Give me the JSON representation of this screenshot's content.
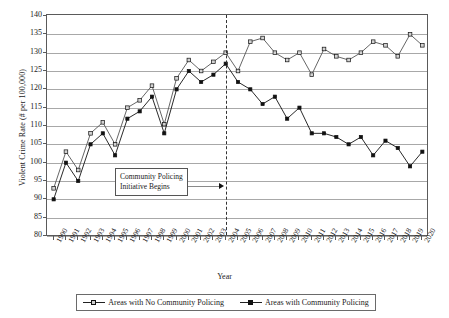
{
  "chart_data": {
    "type": "line",
    "title": "",
    "xlabel": "Year",
    "ylabel": "Violent Crime Rate (# per 100,000)",
    "ylim": [
      80,
      140
    ],
    "ytick_step": 5,
    "yticks": [
      140,
      135,
      130,
      125,
      120,
      115,
      110,
      105,
      100,
      95,
      90,
      85,
      80
    ],
    "grid": true,
    "legend_position": "bottom",
    "categories": [
      "1990",
      "1991",
      "1992",
      "1993",
      "1994",
      "1995",
      "1996",
      "1997",
      "1998",
      "1999",
      "2000",
      "2001",
      "2002",
      "2003",
      "2004",
      "2005",
      "2006",
      "2007",
      "2008",
      "2009",
      "2010",
      "2011",
      "2012",
      "2013",
      "2014",
      "2015",
      "2016",
      "2017",
      "2018",
      "2019",
      "2020"
    ],
    "series": [
      {
        "name": "Areas with No Community Policing",
        "marker": "open-square",
        "values": [
          93,
          103,
          98,
          108,
          111,
          105,
          115,
          117,
          121,
          110.5,
          123,
          128,
          125,
          127.5,
          130,
          125,
          133,
          134,
          130,
          128,
          130,
          124,
          131,
          129,
          128,
          130,
          133,
          132,
          129,
          135,
          132
        ]
      },
      {
        "name": "Areas with Community Policing",
        "marker": "filled-square",
        "values": [
          90,
          100,
          95,
          105,
          108,
          102,
          112,
          114,
          118,
          108,
          120,
          125,
          122,
          124,
          127,
          122,
          120,
          116,
          118,
          112,
          115,
          108,
          108,
          107,
          105,
          107,
          102,
          106,
          104,
          99,
          103
        ]
      }
    ],
    "annotations": [
      {
        "text": "Community Policing\nInitiative Begins",
        "points_to_year": "2004",
        "event_line_year": "2004",
        "event_line_style": "dashed"
      }
    ]
  },
  "colors": {
    "axis": "#5a5a5a",
    "grid": "#a8a8a8",
    "no_policing_line": "#555555",
    "policing_line": "#111111",
    "event_line": "#333333",
    "background": "#ffffff"
  }
}
